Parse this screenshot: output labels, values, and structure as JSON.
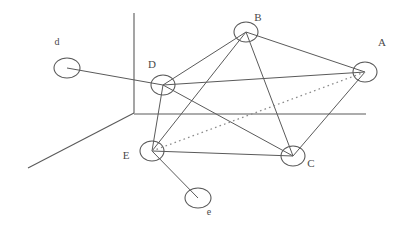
{
  "figure": {
    "type": "graph-diagram",
    "width": 406,
    "height": 226,
    "background": "#ffffff",
    "line_color": "#5a5a5a",
    "dotted_color": "#8c8c8c",
    "label_color": "#4a4a4a"
  },
  "axes": [
    {
      "name": "vertical-axis",
      "x1": 134,
      "y1": 13,
      "x2": 134,
      "y2": 113
    },
    {
      "name": "horizontal-axis",
      "x1": 134,
      "y1": 114,
      "x2": 366,
      "y2": 114
    },
    {
      "name": "depth-axis",
      "x1": 134,
      "y1": 113,
      "x2": 28,
      "y2": 168
    }
  ],
  "nodes": [
    {
      "id": "A",
      "label": "A",
      "cx": 365,
      "cy": 72,
      "rx": 12,
      "ry": 10,
      "label_x": 382,
      "label_y": 46,
      "size": "large"
    },
    {
      "id": "B",
      "label": "B",
      "cx": 246,
      "cy": 32,
      "rx": 12,
      "ry": 10,
      "label_x": 258,
      "label_y": 21,
      "size": "large"
    },
    {
      "id": "C",
      "label": "C",
      "cx": 293,
      "cy": 156,
      "rx": 12,
      "ry": 10,
      "label_x": 311,
      "label_y": 167,
      "size": "large"
    },
    {
      "id": "D",
      "label": "D",
      "cx": 163,
      "cy": 85,
      "rx": 12,
      "ry": 10,
      "label_x": 152,
      "label_y": 68,
      "size": "large"
    },
    {
      "id": "E",
      "label": "E",
      "cx": 152,
      "cy": 151,
      "rx": 12,
      "ry": 10,
      "label_x": 126,
      "label_y": 159,
      "size": "large"
    },
    {
      "id": "d",
      "label": "d",
      "cx": 67,
      "cy": 68,
      "rx": 13,
      "ry": 10,
      "label_x": 57,
      "label_y": 45,
      "size": "small"
    },
    {
      "id": "e",
      "label": "e",
      "cx": 198,
      "cy": 198,
      "rx": 13,
      "ry": 10,
      "label_x": 209,
      "label_y": 215,
      "size": "small"
    }
  ],
  "edges": [
    {
      "from": "d",
      "to": "D",
      "style": "solid"
    },
    {
      "from": "D",
      "to": "B",
      "style": "solid"
    },
    {
      "from": "D",
      "to": "A",
      "style": "solid"
    },
    {
      "from": "D",
      "to": "C",
      "style": "solid"
    },
    {
      "from": "D",
      "to": "E",
      "style": "solid"
    },
    {
      "from": "B",
      "to": "A",
      "style": "solid"
    },
    {
      "from": "B",
      "to": "C",
      "style": "solid"
    },
    {
      "from": "B",
      "to": "E",
      "style": "solid"
    },
    {
      "from": "A",
      "to": "C",
      "style": "solid"
    },
    {
      "from": "E",
      "to": "C",
      "style": "solid"
    },
    {
      "from": "E",
      "to": "e",
      "style": "solid"
    },
    {
      "from": "E",
      "to": "A",
      "style": "dotted"
    }
  ]
}
